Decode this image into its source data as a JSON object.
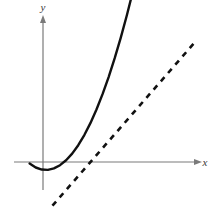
{
  "figure": {
    "title": "",
    "background_color": "#ffffff",
    "width": 219,
    "height": 209
  },
  "axes": {
    "x_label": "x",
    "y_label": "y",
    "axis_color": "#7a7a7a",
    "origin_px": {
      "x": 43,
      "y": 162
    },
    "x_axis_from_px": 14,
    "x_axis_to_px": 201,
    "y_axis_from_px": 17,
    "y_axis_to_px": 190,
    "ticks": [],
    "tick_labels": [],
    "grid": false
  },
  "chart_data": {
    "type": "line",
    "title": "",
    "xlabel": "x",
    "ylabel": "y",
    "grid": false,
    "legend": null,
    "xlim": [
      -1.2,
      6.5
    ],
    "ylim": [
      -3.0,
      5.0
    ],
    "annotations": [
      {
        "name": "tangency-point",
        "x": 2.95,
        "y": 1.05,
        "label": "",
        "visible_marker": false
      }
    ],
    "series": [
      {
        "name": "curve",
        "style": "solid",
        "color": "#111111",
        "width": 2.4,
        "x": [
          -0.55,
          -0.3,
          -0.05,
          0.2,
          0.45,
          0.7,
          0.95,
          1.2,
          1.45,
          1.7,
          1.95,
          2.2,
          2.45,
          2.7,
          2.95,
          3.2,
          3.45,
          3.7,
          3.95,
          4.2,
          4.45,
          4.7,
          4.95
        ],
        "y": [
          -0.05,
          -0.19,
          -0.26,
          -0.27,
          -0.22,
          -0.11,
          0.06,
          0.29,
          0.58,
          0.93,
          1.34,
          1.81,
          2.34,
          2.93,
          3.58,
          4.29,
          5.06,
          5.89,
          6.78,
          7.73,
          8.74,
          9.81,
          10.94
        ]
      },
      {
        "name": "tangent-line",
        "style": "dashed",
        "color": "#111111",
        "width": 2.6,
        "dash_pattern": [
          5.5,
          5.5
        ],
        "x": [
          -0.8,
          6.3
        ],
        "y": [
          -2.65,
          4.18
        ]
      }
    ]
  },
  "elements": {
    "curve_name": "solid-curve",
    "tangent_name": "dashed-tangent-line",
    "x_axis_name": "x-axis",
    "y_axis_name": "y-axis"
  }
}
